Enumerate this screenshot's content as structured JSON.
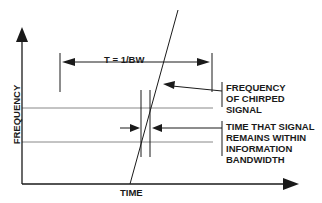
{
  "diagram": {
    "y_axis_label": "FREQUENCY",
    "x_axis_label": "TIME",
    "period_label": "T = 1/BW",
    "annotation_chirp": [
      "FREQUENCY",
      "OF CHIRPED",
      "SIGNAL"
    ],
    "annotation_time": [
      "TIME THAT SIGNAL",
      "REMAINS WITHIN",
      "INFORMATION",
      "BANDWIDTH"
    ],
    "colors": {
      "line": "#1a1a1a",
      "band_line": "#888888",
      "background": "#ffffff"
    }
  }
}
